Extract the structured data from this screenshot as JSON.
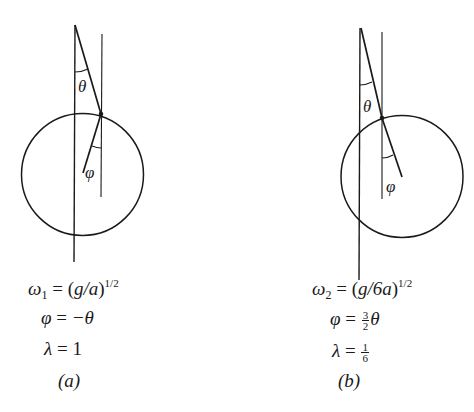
{
  "figure": {
    "panels": [
      {
        "id": "a",
        "caption": "(a)",
        "angle_labels": {
          "upper": "θ",
          "lower": "φ"
        },
        "equations": {
          "omega": {
            "symbol": "ω",
            "subscript": "1",
            "eq": " = (",
            "body_it": "g/a",
            "close": ")",
            "exponent": "1/2"
          },
          "phi": {
            "lhs": "φ",
            "eq": " = ",
            "rhs": "−θ"
          },
          "lambda": {
            "lhs": "λ",
            "eq": " = ",
            "rhs": "1"
          }
        },
        "geometry": {
          "long_vertical": {
            "x": 75,
            "y1": 25,
            "y2": 262
          },
          "short_vertical": {
            "x": 101,
            "y1": 34,
            "y2": 197
          },
          "apex": [
            75,
            25
          ],
          "attachment": [
            101,
            114
          ],
          "rod_end": [
            83,
            173
          ],
          "circle": {
            "cx": 82.5,
            "cy": 174.5,
            "r": 61
          }
        }
      },
      {
        "id": "b",
        "caption": "(b)",
        "angle_labels": {
          "upper": "θ",
          "lower": "φ"
        },
        "equations": {
          "omega": {
            "symbol": "ω",
            "subscript": "2",
            "eq": " = (",
            "body_it": "g/6a",
            "close": ")",
            "exponent": "1/2"
          },
          "phi": {
            "lhs": "φ",
            "eq": " = ",
            "frac_num": "3",
            "frac_den": "2",
            "rhs": "θ"
          },
          "lambda": {
            "lhs": "λ",
            "eq": " = ",
            "frac_num": "1",
            "frac_den": "6"
          }
        },
        "geometry": {
          "long_vertical": {
            "x": 360,
            "y1": 28,
            "y2": 280
          },
          "short_vertical": {
            "x": 382,
            "y1": 32,
            "y2": 199
          },
          "apex": [
            361,
            28
          ],
          "attachment": [
            382,
            118
          ],
          "rod_end": [
            402,
            177
          ],
          "circle": {
            "cx": 402,
            "cy": 176.5,
            "r": 61
          }
        }
      }
    ],
    "stroke_color": "#1a1a1a",
    "background": "#ffffff"
  }
}
